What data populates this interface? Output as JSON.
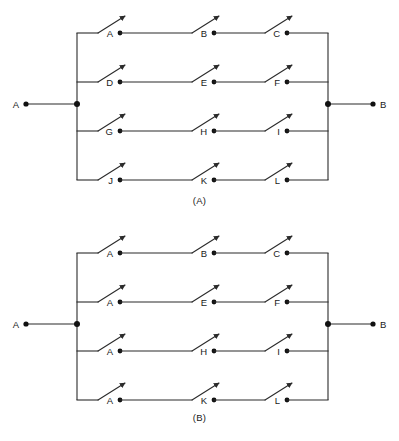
{
  "figures": [
    {
      "id": "A",
      "caption": "(A)",
      "terminals": {
        "left": "A",
        "right": "B"
      },
      "rows": [
        {
          "switches": [
            "A",
            "B",
            "C"
          ]
        },
        {
          "switches": [
            "D",
            "E",
            "F"
          ]
        },
        {
          "switches": [
            "G",
            "H",
            "I"
          ]
        },
        {
          "switches": [
            "J",
            "K",
            "L"
          ]
        }
      ]
    },
    {
      "id": "B",
      "caption": "(B)",
      "terminals": {
        "left": "A",
        "right": "B"
      },
      "rows": [
        {
          "switches": [
            "A",
            "B",
            "C"
          ]
        },
        {
          "switches": [
            "A",
            "E",
            "F"
          ]
        },
        {
          "switches": [
            "A",
            "H",
            "I"
          ]
        },
        {
          "switches": [
            "A",
            "K",
            "L"
          ]
        }
      ]
    }
  ],
  "geometry": {
    "row_y": [
      33,
      82,
      131,
      180
    ],
    "bus_left_x": 77,
    "bus_right_x": 328,
    "terminal_left_x": 26,
    "terminal_right_x": 373,
    "terminal_y": 104,
    "switch_col_x": [
      98,
      192,
      265
    ],
    "blade_rise": 17,
    "blade_run": 27,
    "contact_offset": 22
  },
  "colors": {
    "wire": "#2b2b2b",
    "node": "#111111",
    "text": "#1a1a1a",
    "background": "#ffffff"
  }
}
